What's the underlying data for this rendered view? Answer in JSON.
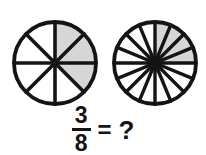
{
  "figure": {
    "background_color": "#ffffff",
    "stroke_color": "#141414",
    "shade_color": "#d6d6d6",
    "circles": [
      {
        "name": "left-circle",
        "label": "eight-part-circle",
        "center_x": 55,
        "center_y": 63,
        "radius": 41,
        "total_sectors": 8,
        "shaded_sectors": 3,
        "shaded_indices": [
          2,
          3,
          4
        ],
        "start_angle_deg": 0,
        "sector_angle_deg": 45,
        "fraction_shown": "3/8"
      },
      {
        "name": "right-circle",
        "label": "sixteen-part-circle",
        "center_x": 155,
        "center_y": 63,
        "radius": 41,
        "total_sectors": 16,
        "shaded_sectors": 4,
        "shaded_indices": [
          4,
          5,
          6,
          7
        ],
        "start_angle_deg": 0,
        "sector_angle_deg": 22.5,
        "fraction_shown": "?"
      }
    ]
  },
  "equation": {
    "numerator": "3",
    "denominator": "8",
    "equals": "=",
    "question": "?",
    "full_text": "3/8 = ?"
  },
  "chart_data": {
    "type": "pie",
    "title": "3/8 = ?",
    "charts": [
      {
        "name": "left-circle",
        "slices": 8,
        "shaded": 3,
        "fraction": "3/8",
        "values": [
          12.5,
          12.5,
          12.5,
          12.5,
          12.5,
          12.5,
          12.5,
          12.5
        ],
        "shaded_flags": [
          false,
          false,
          true,
          true,
          true,
          false,
          false,
          false
        ]
      },
      {
        "name": "right-circle",
        "slices": 16,
        "shaded": 4,
        "fraction": "?",
        "values": [
          6.25,
          6.25,
          6.25,
          6.25,
          6.25,
          6.25,
          6.25,
          6.25,
          6.25,
          6.25,
          6.25,
          6.25,
          6.25,
          6.25,
          6.25,
          6.25
        ],
        "shaded_flags": [
          false,
          false,
          false,
          false,
          true,
          true,
          true,
          true,
          false,
          false,
          false,
          false,
          false,
          false,
          false,
          false
        ]
      }
    ],
    "legend": [],
    "xlabel": "",
    "ylabel": ""
  }
}
